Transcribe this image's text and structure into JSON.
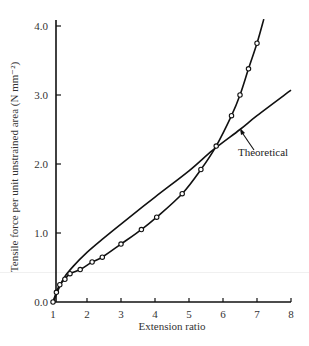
{
  "chart_data": {
    "type": "line",
    "title": "",
    "xlabel": "Extension ratio",
    "ylabel": "Tensile force per unit unstrained area (N mm⁻²)",
    "xlim": [
      1,
      8
    ],
    "ylim": [
      0,
      4.0
    ],
    "x_ticks": [
      "1",
      "2",
      "3",
      "4",
      "5",
      "6",
      "7",
      "8"
    ],
    "y_ticks": [
      "0.0",
      "1.0",
      "2.0",
      "3.0",
      "4.0"
    ],
    "grid": false,
    "legend": null,
    "series": [
      {
        "name": "Experimental",
        "marker": "open-circle",
        "x": [
          1.0,
          1.1,
          1.2,
          1.35,
          1.5,
          1.8,
          2.15,
          2.45,
          3.0,
          3.6,
          4.05,
          4.8,
          5.35,
          5.8,
          6.25,
          6.5,
          6.75,
          7.0
        ],
        "y": [
          0.0,
          0.14,
          0.25,
          0.33,
          0.41,
          0.47,
          0.58,
          0.65,
          0.84,
          1.05,
          1.23,
          1.57,
          1.92,
          2.26,
          2.7,
          3.0,
          3.38,
          3.75
        ],
        "curve_extends_to": {
          "x": 7.2,
          "y": 4.1
        }
      },
      {
        "name": "Theoretical",
        "marker": "none",
        "x": [
          1.0,
          1.3,
          1.6,
          2.0,
          2.5,
          3.0,
          4.0,
          5.0,
          5.7,
          6.5,
          7.0,
          8.0
        ],
        "y": [
          0.0,
          0.33,
          0.52,
          0.72,
          0.93,
          1.13,
          1.52,
          1.9,
          2.2,
          2.5,
          2.7,
          3.07
        ]
      }
    ],
    "annotations": [
      {
        "text": "Theoretical",
        "points_to": {
          "x": 6.5,
          "y": 2.55
        }
      }
    ]
  }
}
